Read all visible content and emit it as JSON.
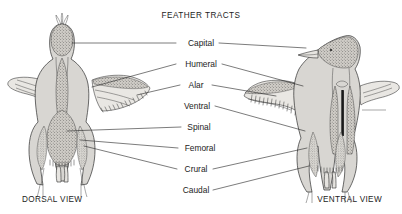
{
  "diagram": {
    "title": "FEATHER TRACTS",
    "background_color": "#ffffff",
    "ink_color": "#1c1c1c",
    "body_fill_color": "#d8d6d2",
    "tract_fill_color": "#bdbab4",
    "wing_fill_color": "#e9e7e3"
  },
  "labels": [
    {
      "id": "capital",
      "text": "Capital",
      "y": 46
    },
    {
      "id": "humeral",
      "text": "Humeral",
      "y": 67
    },
    {
      "id": "alar",
      "text": "Alar",
      "y": 88
    },
    {
      "id": "ventral",
      "text": "Ventral",
      "y": 109
    },
    {
      "id": "spinal",
      "text": "Spinal",
      "y": 130
    },
    {
      "id": "femoral",
      "text": "Femoral",
      "y": 151
    },
    {
      "id": "crural",
      "text": "Crural",
      "y": 172
    },
    {
      "id": "caudal",
      "text": "Caudal",
      "y": 193
    }
  ],
  "views": {
    "left": {
      "id": "dorsal-view",
      "caption": "DORSAL VIEW"
    },
    "right": {
      "id": "ventral-view",
      "caption": "VENTRAL VIEW"
    }
  }
}
